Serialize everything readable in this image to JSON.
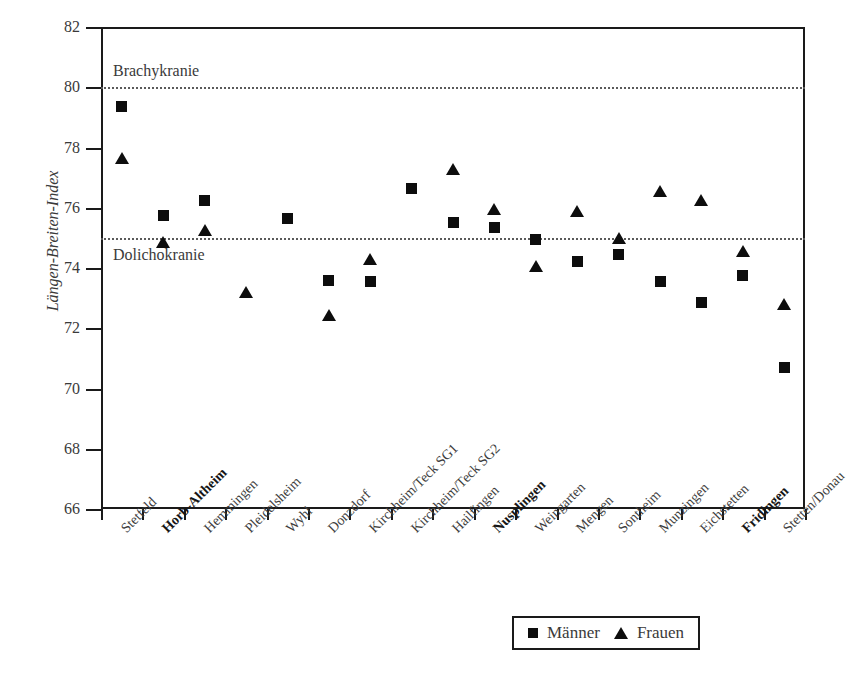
{
  "chart_data": {
    "type": "scatter",
    "title": "",
    "xlabel": "",
    "ylabel": "Längen-Breiten-Index",
    "ylim": [
      66,
      82
    ],
    "yticks": [
      66,
      68,
      70,
      72,
      74,
      76,
      78,
      80,
      82
    ],
    "grid": false,
    "legend_position": "bottom-right",
    "categories": [
      "Stetfeld",
      "Horb-Altheim",
      "Hemmingen",
      "Pleidelsheim",
      "Wyhl",
      "Donzdorf",
      "Kirchheim/Teck SG1",
      "Kirchheim/Teck SG2",
      "Hailfingen",
      "Nusplingen",
      "Weingarten",
      "Mengen",
      "Sontheim",
      "Munzingen",
      "Eichstetten",
      "Fridingen",
      "Stetten/Donau"
    ],
    "categories_bold": [
      false,
      true,
      false,
      false,
      false,
      false,
      false,
      false,
      false,
      true,
      false,
      false,
      false,
      false,
      false,
      true,
      false
    ],
    "series": [
      {
        "name": "Männer",
        "marker": "square",
        "values": [
          79.35,
          75.75,
          76.25,
          null,
          75.65,
          73.6,
          73.55,
          76.65,
          75.5,
          75.35,
          74.95,
          74.2,
          74.45,
          73.55,
          72.85,
          73.75,
          70.7
        ]
      },
      {
        "name": "Frauen",
        "marker": "triangle",
        "values": [
          77.65,
          74.85,
          75.25,
          73.2,
          null,
          72.45,
          74.3,
          null,
          77.3,
          75.95,
          74.05,
          75.9,
          75.0,
          76.55,
          76.25,
          74.55,
          72.8
        ]
      }
    ],
    "reference_lines": [
      {
        "value": 80,
        "label": "Brachykranie",
        "label_side": "above"
      },
      {
        "value": 75,
        "label": "Dolichokranie",
        "label_side": "below"
      }
    ],
    "legend": [
      {
        "label": "Männer",
        "marker": "square"
      },
      {
        "label": "Frauen",
        "marker": "triangle"
      }
    ],
    "colors": {
      "marker": "#0d0d0d",
      "axis": "#1a1a1a",
      "text": "#3a3a3a",
      "reference_line": "#5a5a5a"
    }
  },
  "caption_partial": ""
}
